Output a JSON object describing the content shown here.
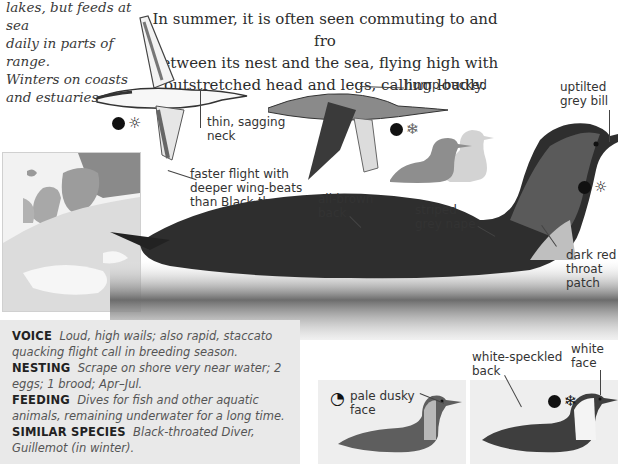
{
  "intro_text": {
    "lines": [
      "lakes, but feeds at sea",
      "daily in parts of range.",
      "Winters on coasts",
      "and estuaries."
    ]
  },
  "description": {
    "lines": [
      "In summer, it is often seen commuting to and fro",
      "between its nest and the sea, flying high with",
      "outstretched head and legs, calling loudly."
    ]
  },
  "labels": {
    "thin_neck": [
      "thin, sagging",
      "neck"
    ],
    "faster_flight": [
      "faster flight with",
      "deeper wing-beats",
      "than Black-throated"
    ],
    "hump_backed": "hump-backed",
    "uptilted_bill": [
      "uptilted",
      "grey bill"
    ],
    "all_brown_back": [
      "all-brown",
      "back"
    ],
    "striped_nape": [
      "striped",
      "grey nape"
    ],
    "throat_patch": [
      "dark red",
      "throat",
      "patch"
    ],
    "pale_dusky_face": [
      "pale dusky",
      "face"
    ],
    "white_speckled_back": [
      "white-speckled",
      "back"
    ],
    "white_face": [
      "white",
      "face"
    ]
  },
  "symbols": {
    "adult_summer": {
      "sex": "male-female-icon",
      "season": "sun-icon",
      "glyph": "☼"
    },
    "adult_winter": {
      "sex": "male-female-icon",
      "season": "snowflake-icon",
      "glyph": "❄"
    },
    "juvenile": {
      "age": "juvenile-icon",
      "glyph": "◔"
    }
  },
  "info": {
    "voice": {
      "key": "VOICE",
      "value": "Loud, high wails; also rapid, staccato quacking flight call in breeding season."
    },
    "nesting": {
      "key": "NESTING",
      "value": "Scrape on shore very near water; 2 eggs; 1 brood; Apr–Jul."
    },
    "feeding": {
      "key": "FEEDING",
      "value": "Dives for fish and other aquatic animals, remaining underwater for a long time."
    },
    "similar": {
      "key": "SIMILAR SPECIES",
      "value": "Black-throated Diver, Guillemot (in winter)."
    }
  },
  "colors": {
    "background": "#ffffff",
    "info_box": "#e9e9e9",
    "map_breeding": "#7a7a7a",
    "map_land": "#e0e0e0",
    "text": "#333333"
  }
}
